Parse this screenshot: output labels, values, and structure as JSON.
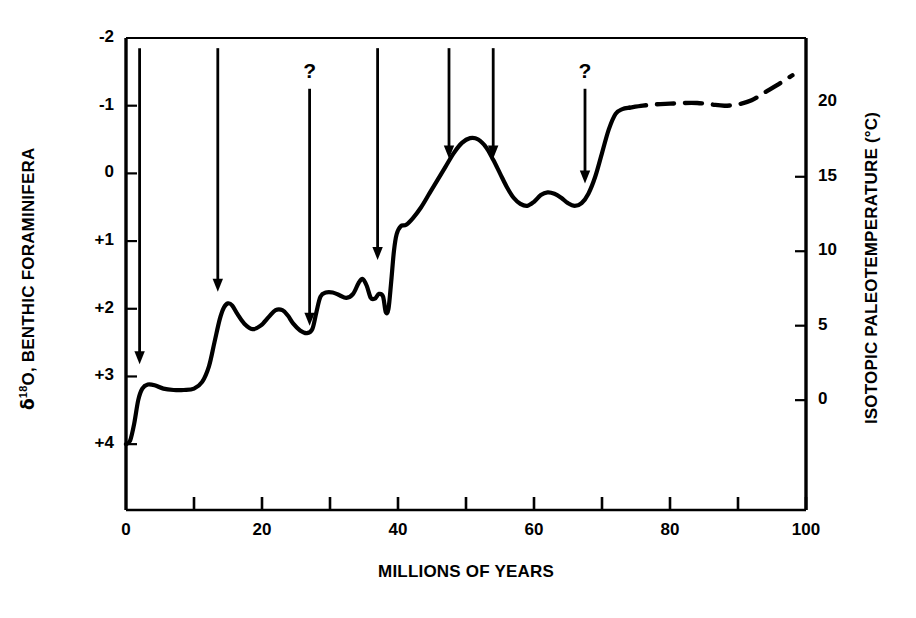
{
  "figure": {
    "background_color": "#ffffff",
    "line_color": "#000000",
    "axis_color": "#000000"
  },
  "labels": {
    "ylabel_left_delta": "δ",
    "ylabel_left_sup": "18",
    "ylabel_left_rest": "O, BENTHIC FORAMINIFERA",
    "ylabel_right": "ISOTOPIC PALEOTEMPERATURE (°C)",
    "xlabel": "MILLIONS OF YEARS",
    "question_mark": "?"
  },
  "chart_data": {
    "type": "line",
    "title": "",
    "xlabel": "MILLIONS OF YEARS",
    "ylabel": "δ 18O, BENTHIC FORAMINIFERA",
    "ylabel_secondary": "ISOTOPIC PALEOTEMPERATURE (°C)",
    "grid": false,
    "legend": "none",
    "xlim": [
      0,
      100
    ],
    "ylim": [
      -2,
      4.5
    ],
    "y_axis_inverted": true,
    "xticks": [
      0,
      10,
      20,
      30,
      40,
      50,
      60,
      70,
      80,
      90,
      100
    ],
    "xtick_labels": [
      "0",
      "",
      "20",
      "",
      "40",
      "",
      "60",
      "",
      "80",
      "",
      "100"
    ],
    "yticks_left": [
      -2,
      -1,
      0,
      1,
      2,
      3,
      4
    ],
    "ytick_labels_left": [
      "-2",
      "-1",
      "0",
      "+1",
      "+2",
      "+3",
      "+4"
    ],
    "yticks_right_values": [
      20,
      15,
      10,
      5,
      0
    ],
    "ytick_labels_right": [
      "20",
      "15",
      "10",
      "5",
      "0"
    ],
    "right_axis_mapping": {
      "delta_minus2_equals_degC": 20,
      "delta_plus4_equals_degC": -2.5,
      "note": "right axis: 0 degC aligns with delta +3.35; 5 degC aligns with delta +2.25"
    },
    "series": [
      {
        "name": "delta-18O benthic foraminifera (solid)",
        "style": "solid",
        "x": [
          0.0,
          0.6,
          1.2,
          1.8,
          2.4,
          3.2,
          4.2,
          5.5,
          7.0,
          8.5,
          10.0,
          11.2,
          12.2,
          13.0,
          13.8,
          14.4,
          15.0,
          15.6,
          16.4,
          17.4,
          18.6,
          19.8,
          21.0,
          22.0,
          23.0,
          23.8,
          24.6,
          25.6,
          26.6,
          27.4,
          28.0,
          28.6,
          29.4,
          30.4,
          31.4,
          32.4,
          33.4,
          34.2,
          34.8,
          35.4,
          36.0,
          36.6,
          37.2,
          37.8,
          38.2,
          38.6,
          39.0,
          39.4,
          39.8,
          40.4,
          41.2,
          42.2,
          43.4,
          44.6,
          45.8,
          47.0,
          48.2,
          49.4,
          50.6,
          51.8,
          53.0,
          54.0,
          55.0,
          56.0,
          57.0,
          58.0,
          59.0,
          60.0,
          61.0,
          62.0,
          63.0,
          64.0,
          65.0,
          66.0,
          67.0,
          68.0,
          69.0,
          70.0,
          71.0,
          72.0,
          73.0,
          74.0
        ],
        "y": [
          4.0,
          3.95,
          3.7,
          3.35,
          3.18,
          3.12,
          3.13,
          3.18,
          3.2,
          3.2,
          3.18,
          3.08,
          2.85,
          2.5,
          2.15,
          1.98,
          1.92,
          1.95,
          2.08,
          2.22,
          2.3,
          2.25,
          2.12,
          2.02,
          2.02,
          2.1,
          2.22,
          2.32,
          2.36,
          2.3,
          2.05,
          1.82,
          1.76,
          1.76,
          1.8,
          1.84,
          1.78,
          1.62,
          1.56,
          1.66,
          1.84,
          1.85,
          1.78,
          1.82,
          2.05,
          2.0,
          1.6,
          1.15,
          0.9,
          0.78,
          0.76,
          0.66,
          0.5,
          0.3,
          0.1,
          -0.1,
          -0.3,
          -0.45,
          -0.52,
          -0.5,
          -0.38,
          -0.2,
          0.0,
          0.2,
          0.36,
          0.45,
          0.48,
          0.42,
          0.32,
          0.28,
          0.3,
          0.36,
          0.44,
          0.48,
          0.44,
          0.3,
          0.05,
          -0.3,
          -0.65,
          -0.88,
          -0.95,
          -0.97
        ]
      },
      {
        "name": "delta-18O benthic foraminifera (dashed, inferred)",
        "style": "dashed",
        "x": [
          74.0,
          76.0,
          78.0,
          80.0,
          82.0,
          84.0,
          86.0,
          88.0,
          90.0,
          92.0,
          94.0,
          96.0,
          98.0
        ],
        "y": [
          -0.97,
          -1.0,
          -1.02,
          -1.03,
          -1.04,
          -1.04,
          -1.02,
          -1.0,
          -1.02,
          -1.08,
          -1.2,
          -1.32,
          -1.45
        ]
      }
    ],
    "annotations": [
      {
        "name": "arrow-1",
        "type": "arrow",
        "x": 2.0,
        "y_start": -1.85,
        "y_end": 2.82,
        "label": ""
      },
      {
        "name": "arrow-2",
        "type": "arrow",
        "x": 13.5,
        "y_start": -1.85,
        "y_end": 1.75,
        "label": ""
      },
      {
        "name": "arrow-3",
        "type": "arrow",
        "x": 27.0,
        "y_start": -1.25,
        "y_end": 2.25,
        "label": "?"
      },
      {
        "name": "arrow-4",
        "type": "arrow",
        "x": 37.0,
        "y_start": -1.85,
        "y_end": 1.28,
        "label": ""
      },
      {
        "name": "arrow-5",
        "type": "arrow",
        "x": 47.5,
        "y_start": -1.85,
        "y_end": -0.22,
        "label": ""
      },
      {
        "name": "arrow-6",
        "type": "arrow",
        "x": 54.0,
        "y_start": -1.85,
        "y_end": -0.22,
        "label": ""
      },
      {
        "name": "arrow-7",
        "type": "arrow",
        "x": 67.5,
        "y_start": -1.25,
        "y_end": 0.15,
        "label": "?"
      }
    ]
  }
}
